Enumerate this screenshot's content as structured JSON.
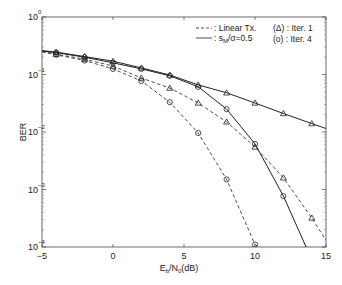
{
  "chart_data": {
    "type": "line",
    "title": "",
    "xlabel": "E_b/N_0(dB)",
    "ylabel": "BER",
    "xlim": [
      -5,
      15
    ],
    "ylim": [
      0.0001,
      1
    ],
    "yscale": "log",
    "grid": false,
    "xticks": [
      -5,
      0,
      5,
      10,
      15
    ],
    "xtick_labels": [
      "-5",
      "0",
      "5",
      "10",
      "15"
    ],
    "yticks": [
      1,
      0.1,
      0.01,
      0.001,
      0.0001
    ],
    "ytick_labels": [
      "10^0",
      "10^-1",
      "10^-2",
      "10^-3",
      "10^-4"
    ],
    "legend": {
      "position": "upper right",
      "line_styles": [
        {
          "style": "dashed",
          "label": ": Linear Tx."
        },
        {
          "style": "solid",
          "label": ": s_M/σ=0.5"
        }
      ],
      "markers": [
        {
          "marker": "triangle",
          "label": "(Δ) :  Iter. 1"
        },
        {
          "marker": "circle",
          "label": "(o) : Iter. 4"
        }
      ]
    },
    "series": [
      {
        "name": "Linear Tx., Iter. 1",
        "style": "dashed",
        "marker": "triangle",
        "x": [
          -5,
          -4,
          -2,
          0,
          2,
          4,
          6,
          8,
          10,
          12,
          14,
          15
        ],
        "y": [
          0.25,
          0.225,
          0.185,
          0.14,
          0.087,
          0.058,
          0.032,
          0.015,
          0.0055,
          0.0016,
          0.00032,
          0.00013
        ]
      },
      {
        "name": "Linear Tx., Iter. 4",
        "style": "dashed",
        "marker": "circle",
        "x": [
          -5,
          -4,
          -2,
          0,
          2,
          4,
          6,
          8,
          10,
          10.3
        ],
        "y": [
          0.25,
          0.22,
          0.175,
          0.125,
          0.077,
          0.033,
          0.0096,
          0.0015,
          0.00011,
          0.0001
        ]
      },
      {
        "name": "s_M/σ=0.5, Iter. 1",
        "style": "solid",
        "marker": "triangle",
        "x": [
          -5,
          -4,
          -2,
          0,
          2,
          4,
          6,
          8,
          10,
          12,
          14,
          15
        ],
        "y": [
          0.26,
          0.245,
          0.205,
          0.17,
          0.13,
          0.098,
          0.066,
          0.048,
          0.032,
          0.021,
          0.014,
          0.0115
        ]
      },
      {
        "name": "s_M/σ=0.5, Iter. 4",
        "style": "solid",
        "marker": "circle",
        "x": [
          -5,
          -4,
          -2,
          0,
          2,
          4,
          6,
          8,
          10,
          12,
          13.6
        ],
        "y": [
          0.255,
          0.24,
          0.2,
          0.16,
          0.125,
          0.095,
          0.061,
          0.025,
          0.0062,
          0.00077,
          0.0001
        ]
      }
    ]
  }
}
